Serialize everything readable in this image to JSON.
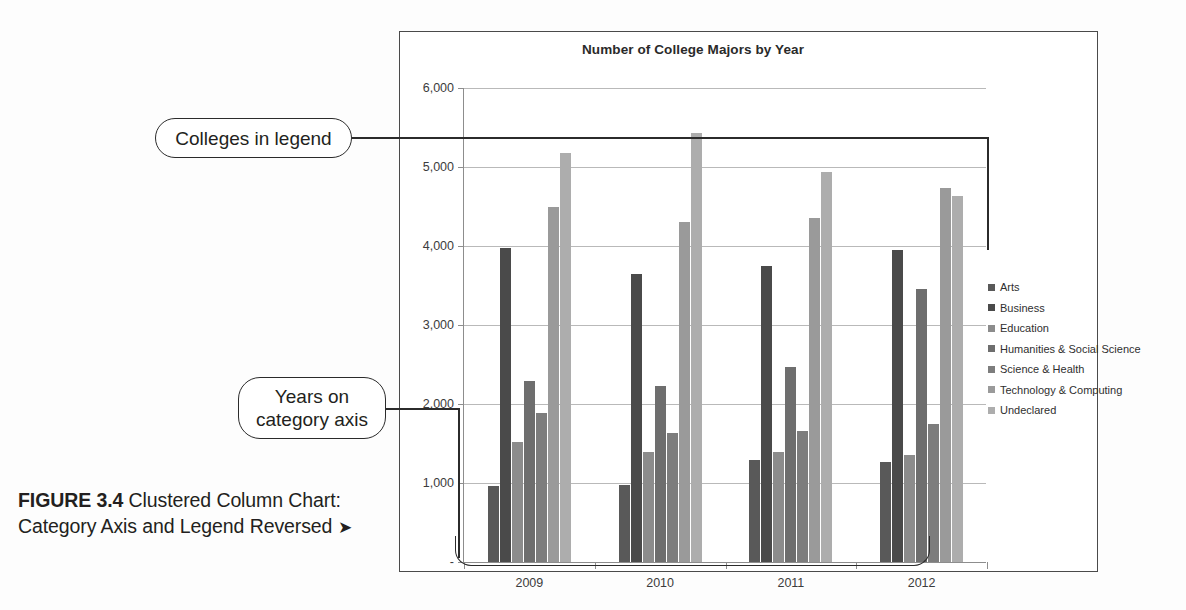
{
  "figure": {
    "label": "FIGURE 3.4",
    "caption": " Clustered Column Chart: Category Axis and Legend Reversed ",
    "arrow": "➤"
  },
  "callouts": {
    "legend_note": "Colleges in legend",
    "axis_note_line1": "Years on",
    "axis_note_line2": "category axis"
  },
  "chart_data": {
    "type": "bar",
    "title": "Number of College Majors by Year",
    "xlabel": "",
    "ylabel": "",
    "categories": [
      "2009",
      "2010",
      "2011",
      "2012"
    ],
    "ylim": [
      0,
      6000
    ],
    "ytick_labels": [
      "-",
      "1,000",
      "2,000",
      "3,000",
      "4,000",
      "5,000",
      "6,000"
    ],
    "ytick_values": [
      0,
      1000,
      2000,
      3000,
      4000,
      5000,
      6000
    ],
    "grid": true,
    "legend_position": "right",
    "series": [
      {
        "name": "Arts",
        "color": "#595959",
        "values": [
          960,
          980,
          1290,
          1270
        ]
      },
      {
        "name": "Business",
        "color": "#4a4a4a",
        "values": [
          3980,
          3640,
          3750,
          3950
        ]
      },
      {
        "name": "Education",
        "color": "#8c8c8c",
        "values": [
          1520,
          1390,
          1390,
          1350
        ]
      },
      {
        "name": "Humanities & Social Science",
        "color": "#6e6e6e",
        "values": [
          2290,
          2230,
          2470,
          3460
        ]
      },
      {
        "name": "Science & Health",
        "color": "#7d7d7d",
        "values": [
          1880,
          1630,
          1660,
          1750
        ]
      },
      {
        "name": "Technology & Computing",
        "color": "#9a9a9a",
        "values": [
          4490,
          4300,
          4360,
          4740
        ]
      },
      {
        "name": "Undeclared",
        "color": "#adadad",
        "values": [
          5180,
          5430,
          4940,
          4630
        ]
      }
    ]
  }
}
